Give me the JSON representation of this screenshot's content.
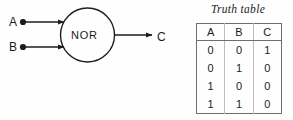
{
  "diagram": {
    "type": "logic-gate-diagram",
    "gate": {
      "label": "NOR",
      "shape": "circle"
    },
    "inputs": [
      {
        "label": "A"
      },
      {
        "label": "B"
      }
    ],
    "output": {
      "label": "C"
    },
    "colors": {
      "line": "#1c1c1c",
      "background": "#fefefe",
      "table_border": "#6e6e6e",
      "table_inner_rule": "#bdbdbd"
    }
  },
  "truth_table": {
    "title": "Truth table",
    "columns": [
      "A",
      "B",
      "C"
    ],
    "rows": [
      [
        "0",
        "0",
        "1"
      ],
      [
        "0",
        "1",
        "0"
      ],
      [
        "1",
        "0",
        "0"
      ],
      [
        "1",
        "1",
        "0"
      ]
    ]
  }
}
